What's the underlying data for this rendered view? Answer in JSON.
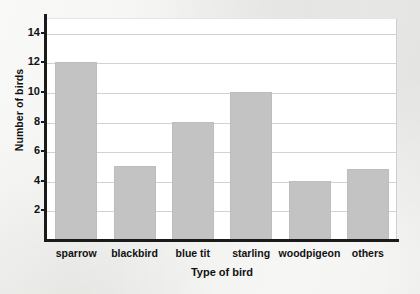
{
  "chart_data": {
    "type": "bar",
    "title": "",
    "xlabel": "Type of bird",
    "ylabel": "Number of birds",
    "categories": [
      "sparrow",
      "blackbird",
      "blue tit",
      "starling",
      "woodpigeon",
      "others"
    ],
    "values": [
      12,
      5,
      8,
      10,
      4,
      4.8
    ],
    "ylim": [
      0,
      15
    ],
    "yticks": [
      2,
      4,
      6,
      8,
      10,
      12,
      14
    ],
    "ytick_labels": [
      "2",
      "4",
      "6",
      "8",
      "10",
      "12",
      "14"
    ],
    "grid": "horizontal",
    "legend": "none",
    "bar_color": "#c3c3c3",
    "axis_color": "#1a1a1a",
    "gridline_color": "#d2d2d2",
    "plot_background": "#ffffff",
    "page_background": "#eeeeec"
  }
}
